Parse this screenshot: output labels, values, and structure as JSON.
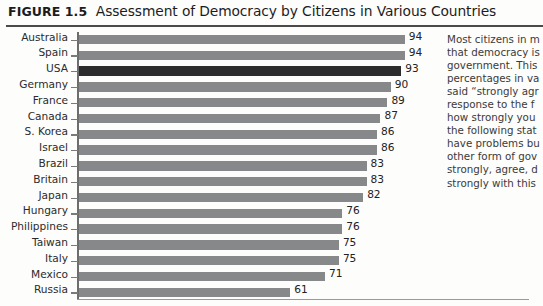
{
  "figure": {
    "label": "FIGURE 1.5",
    "title": "Assessment of Democracy by Citizens in Various Countries"
  },
  "chart_data": {
    "type": "bar",
    "orientation": "horizontal",
    "title": "Assessment of Democracy by Citizens in Various Countries",
    "xlabel": "",
    "ylabel": "",
    "xlim": [
      0,
      100
    ],
    "grid": false,
    "legend": null,
    "highlight_category": "USA",
    "highlight_color": "#2c2c2c",
    "bar_color": "#86888a",
    "categories": [
      "Australia",
      "Spain",
      "USA",
      "Germany",
      "France",
      "Canada",
      "S. Korea",
      "Israel",
      "Brazil",
      "Britain",
      "Japan",
      "Hungary",
      "Philippines",
      "Taiwan",
      "Italy",
      "Mexico",
      "Russia"
    ],
    "values": [
      94,
      94,
      93,
      90,
      89,
      87,
      86,
      86,
      83,
      83,
      82,
      76,
      76,
      75,
      75,
      71,
      61
    ],
    "value_labels": [
      "94",
      "94",
      "93",
      "90",
      "89",
      "87",
      "86",
      "86",
      "83",
      "83",
      "82",
      "76",
      "76",
      "75",
      "75",
      "71",
      "61"
    ]
  },
  "caption": {
    "lines": [
      "Most citizens in m",
      "that democracy is",
      "government. This",
      "percentages in va",
      "said “strongly agr",
      "response to the f",
      "how strongly you",
      "the following stat",
      "have problems bu",
      "other form of gov",
      "strongly, agree, d",
      "strongly with this"
    ]
  }
}
